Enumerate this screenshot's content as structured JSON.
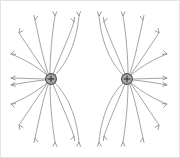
{
  "figure": {
    "background_color": "#ffffff",
    "border_color": "#e3e3e3",
    "line_color": "#9a9a9a",
    "arrow_color": "#8e8e8e",
    "charge_fill_color": "#a8a8a8",
    "charge_stroke_color": "#4a4a4a",
    "plus_sign": "+",
    "charge_label_left": "+",
    "charge_label_right": "+"
  },
  "chart_data": {
    "type": "scatter",
    "xlabel": "",
    "ylabel": "",
    "xlim": [
      0,
      180
    ],
    "ylim": [
      0,
      158
    ],
    "grid": false,
    "legend": null,
    "annotations": [],
    "charges": [
      {
        "name": "left-charge",
        "sign": "+",
        "symbol": "+",
        "x": 51,
        "y": 79,
        "radius": 5.4
      },
      {
        "name": "right-charge",
        "sign": "+",
        "symbol": "+",
        "x": 127,
        "y": 79,
        "radius": 5.4
      }
    ],
    "field_lines": [
      {
        "charge": "left",
        "quadrant": "upper-left",
        "path": "M 47 75 C 36 66 22 58 11 54",
        "arrow_at": [
          11,
          54
        ],
        "arrow_angle": 200
      },
      {
        "charge": "left",
        "quadrant": "upper-left",
        "path": "M 47 74 C 38 62 28 46 19 33",
        "arrow_at": [
          19,
          33
        ],
        "arrow_angle": 235
      },
      {
        "charge": "left",
        "quadrant": "upper-left",
        "path": "M 48 73 C 43 59 39 38 35 20",
        "arrow_at": [
          35,
          20
        ],
        "arrow_angle": 258
      },
      {
        "charge": "left",
        "quadrant": "upper-left",
        "path": "M 50 73 C 50 58 52 33 55 16",
        "arrow_at": [
          55,
          16
        ],
        "arrow_angle": 272
      },
      {
        "charge": "left",
        "quadrant": "upper-right",
        "path": "M 53 74 C 58 61 68 40 74 22",
        "arrow_at": [
          74,
          22
        ],
        "arrow_angle": 287
      },
      {
        "charge": "left",
        "quadrant": "upper-right",
        "path": "M 55 75 C 64 66 76 48 79 16",
        "arrow_at": [
          79,
          16
        ],
        "arrow_angle": 275
      },
      {
        "charge": "left",
        "quadrant": "left",
        "path": "M 45 79 C 34 79 22 78 11 78",
        "arrow_at": [
          11,
          78
        ],
        "arrow_angle": 180
      },
      {
        "charge": "left",
        "quadrant": "left",
        "path": "M 45 80 C 34 81 22 83 11 85",
        "arrow_at": [
          11,
          85
        ],
        "arrow_angle": 188
      },
      {
        "charge": "left",
        "quadrant": "lower-left",
        "path": "M 47 83 C 36 92 22 100 11 104",
        "arrow_at": [
          11,
          104
        ],
        "arrow_angle": 160
      },
      {
        "charge": "left",
        "quadrant": "lower-left",
        "path": "M 47 84 C 38 96 28 112 19 125",
        "arrow_at": [
          19,
          125
        ],
        "arrow_angle": 125
      },
      {
        "charge": "left",
        "quadrant": "lower-left",
        "path": "M 48 85 C 43 99 39 120 35 138",
        "arrow_at": [
          35,
          138
        ],
        "arrow_angle": 102
      },
      {
        "charge": "left",
        "quadrant": "lower-left",
        "path": "M 50 85 C 50 100 52 125 55 142",
        "arrow_at": [
          55,
          142
        ],
        "arrow_angle": 88
      },
      {
        "charge": "left",
        "quadrant": "lower-right",
        "path": "M 53 84 C 58 97 68 118 74 136",
        "arrow_at": [
          74,
          136
        ],
        "arrow_angle": 73
      },
      {
        "charge": "left",
        "quadrant": "lower-right",
        "path": "M 55 83 C 64 92 76 110 79 142",
        "arrow_at": [
          79,
          142
        ],
        "arrow_angle": 85
      },
      {
        "charge": "right",
        "quadrant": "upper-right",
        "path": "M 131 75 C 142 66 156 58 167 54",
        "arrow_at": [
          167,
          54
        ],
        "arrow_angle": 340
      },
      {
        "charge": "right",
        "quadrant": "upper-right",
        "path": "M 131 74 C 140 62 150 46 159 33",
        "arrow_at": [
          159,
          33
        ],
        "arrow_angle": 305
      },
      {
        "charge": "right",
        "quadrant": "upper-right",
        "path": "M 130 73 C 135 59 139 38 143 20",
        "arrow_at": [
          143,
          20
        ],
        "arrow_angle": 282
      },
      {
        "charge": "right",
        "quadrant": "upper-right",
        "path": "M 128 73 C 128 58 126 33 123 16",
        "arrow_at": [
          123,
          16
        ],
        "arrow_angle": 268
      },
      {
        "charge": "right",
        "quadrant": "upper-left",
        "path": "M 125 74 C 120 61 110 40 104 22",
        "arrow_at": [
          104,
          22
        ],
        "arrow_angle": 253
      },
      {
        "charge": "right",
        "quadrant": "upper-left",
        "path": "M 123 75 C 114 66 102 48 99 16",
        "arrow_at": [
          99,
          16
        ],
        "arrow_angle": 265
      },
      {
        "charge": "right",
        "quadrant": "right",
        "path": "M 133 79 C 144 79 156 78 167 78",
        "arrow_at": [
          167,
          78
        ],
        "arrow_angle": 0
      },
      {
        "charge": "right",
        "quadrant": "right",
        "path": "M 133 80 C 144 81 156 83 167 85",
        "arrow_at": [
          167,
          85
        ],
        "arrow_angle": 352
      },
      {
        "charge": "right",
        "quadrant": "lower-right",
        "path": "M 131 83 C 142 92 156 100 167 104",
        "arrow_at": [
          167,
          104
        ],
        "arrow_angle": 20
      },
      {
        "charge": "right",
        "quadrant": "lower-right",
        "path": "M 131 84 C 140 96 150 112 159 125",
        "arrow_at": [
          159,
          125
        ],
        "arrow_angle": 55
      },
      {
        "charge": "right",
        "quadrant": "lower-right",
        "path": "M 130 85 C 135 99 139 120 143 138",
        "arrow_at": [
          143,
          138
        ],
        "arrow_angle": 78
      },
      {
        "charge": "right",
        "quadrant": "lower-right",
        "path": "M 128 85 C 128 100 126 125 123 142",
        "arrow_at": [
          123,
          142
        ],
        "arrow_angle": 92
      },
      {
        "charge": "right",
        "quadrant": "lower-left",
        "path": "M 125 84 C 120 97 110 118 104 136",
        "arrow_at": [
          104,
          136
        ],
        "arrow_angle": 107
      },
      {
        "charge": "right",
        "quadrant": "lower-left",
        "path": "M 123 83 C 114 92 102 110 99 142",
        "arrow_at": [
          99,
          142
        ],
        "arrow_angle": 95
      }
    ]
  }
}
